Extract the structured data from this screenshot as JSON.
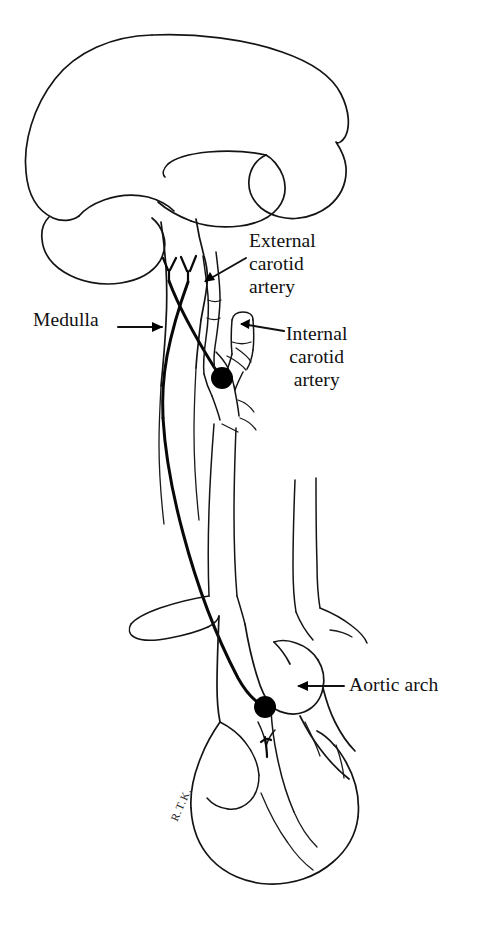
{
  "figure": {
    "kind": "anatomical-line-drawing",
    "background_color": "#ffffff",
    "ink_color": "#111111",
    "signature": "R.T.K."
  },
  "labels": {
    "external_carotid": {
      "line1": "External",
      "line2": "carotid",
      "line3": "artery"
    },
    "internal_carotid": {
      "line1": "Internal",
      "line2": "carotid",
      "line3": "artery"
    },
    "medulla": {
      "text": "Medulla"
    },
    "aortic_arch": {
      "text": "Aortic arch"
    }
  },
  "structures": [
    {
      "name": "cerebrum",
      "type": "outline"
    },
    {
      "name": "cerebellum",
      "type": "outline"
    },
    {
      "name": "brainstem-medulla",
      "type": "outline"
    },
    {
      "name": "external-carotid-artery",
      "type": "vessel"
    },
    {
      "name": "internal-carotid-artery",
      "type": "vessel"
    },
    {
      "name": "common-carotid-artery",
      "type": "vessel"
    },
    {
      "name": "subclavian-artery",
      "type": "vessel"
    },
    {
      "name": "aortic-arch",
      "type": "vessel"
    },
    {
      "name": "heart",
      "type": "outline"
    },
    {
      "name": "glossopharyngeal-nerve",
      "type": "nerve"
    },
    {
      "name": "vagus-nerve",
      "type": "nerve"
    }
  ],
  "receptor_markers": [
    {
      "name": "carotid-sinus-receptor",
      "x": 222,
      "y": 378,
      "r": 11
    },
    {
      "name": "aortic-arch-receptor",
      "x": 265,
      "y": 707,
      "r": 11
    }
  ]
}
